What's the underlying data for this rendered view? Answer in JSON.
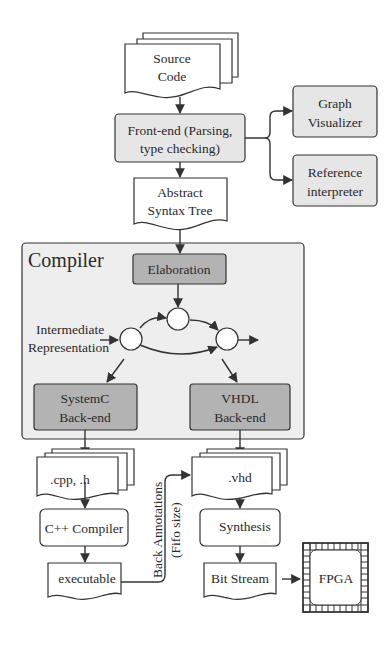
{
  "diagram": {
    "source": {
      "line1": "Source",
      "line2": "Code"
    },
    "frontend": {
      "line1": "Front-end (Parsing,",
      "line2": "type checking)"
    },
    "graph_visualizer": {
      "line1": "Graph",
      "line2": "Visualizer"
    },
    "reference_interpreter": {
      "line1": "Reference",
      "line2": "interpreter"
    },
    "ast": {
      "line1": "Abstract",
      "line2": "Syntax Tree"
    },
    "compiler": {
      "title": "Compiler"
    },
    "elaboration": {
      "label": "Elaboration"
    },
    "ir": {
      "line1": "Intermediate",
      "line2": "Representation"
    },
    "systemc": {
      "line1": "SystemC",
      "line2": "Back-end"
    },
    "vhdl_backend": {
      "line1": "VHDL",
      "line2": "Back-end"
    },
    "cpp_files": {
      "label": ".cpp, .h"
    },
    "vhd_files": {
      "label": ".vhd"
    },
    "cpp_compiler": {
      "label": "C++ Compiler"
    },
    "synthesis": {
      "label": "Synthesis"
    },
    "executable": {
      "label": "executable"
    },
    "bitstream": {
      "label": "Bit Stream"
    },
    "fpga": {
      "label": "FPGA"
    },
    "back_annotations": {
      "line1": "Back Annotations",
      "line2": "(Fifo size)"
    }
  },
  "colors": {
    "light_gray": "#e6e6e6",
    "dark_gray": "#b3b3b3",
    "compiler_bg": "#eeeeee",
    "stroke": "#333333"
  }
}
